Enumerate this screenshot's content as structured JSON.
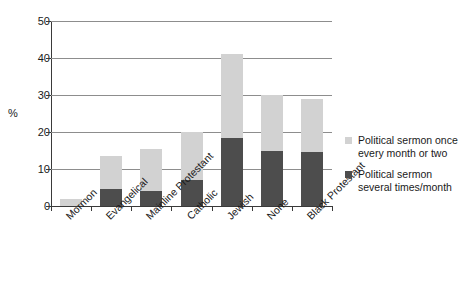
{
  "chart_data": {
    "type": "bar",
    "subtype": "stacked",
    "title": "",
    "xlabel": "",
    "ylabel": "%",
    "ylim": [
      0,
      50
    ],
    "yticks": [
      0,
      10,
      20,
      30,
      40,
      50
    ],
    "grid": true,
    "legend_position": "right",
    "categories": [
      "Mormon",
      "Evangelical",
      "Mainline Protestant",
      "Catholic",
      "Jewish",
      "None",
      "Black Protestant"
    ],
    "series": [
      {
        "name": "Political sermon several times/month",
        "color": "#4d4d4d",
        "values": [
          0,
          4.5,
          4,
          7,
          18.5,
          15,
          14.5
        ]
      },
      {
        "name": "Political sermon once every month or two",
        "color": "#d2d2d2",
        "values": [
          2,
          9,
          11.5,
          13,
          22.5,
          15,
          14.5
        ]
      }
    ],
    "totals": [
      2,
      13.5,
      15.5,
      20,
      41,
      30,
      29
    ]
  },
  "legend": {
    "entries": [
      {
        "swatch_name": "legend-swatch-light",
        "label": "Political sermon once every month or two",
        "color": "#d2d2d2"
      },
      {
        "swatch_name": "legend-swatch-dark",
        "label": "Political sermon several times/month",
        "color": "#4d4d4d"
      }
    ]
  },
  "axes": {
    "y_title": "%",
    "y_tick_labels": [
      "0",
      "10",
      "20",
      "30",
      "40",
      "50"
    ]
  }
}
